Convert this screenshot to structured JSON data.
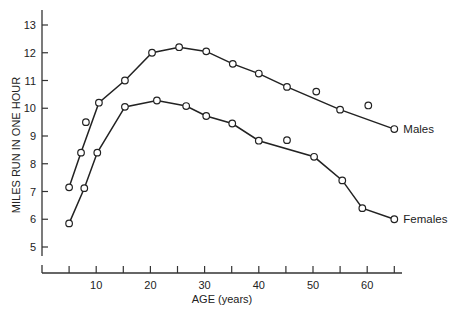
{
  "chart_data": {
    "type": "line",
    "title": "",
    "xlabel": "AGE (years)",
    "ylabel": "MILES RUN IN ONE HOUR",
    "xlim": [
      0,
      66
    ],
    "ylim": [
      4.5,
      13.5
    ],
    "x_ticks": [
      5,
      10,
      15,
      20,
      25,
      30,
      35,
      40,
      45,
      50,
      55,
      60,
      65
    ],
    "x_tick_labels": [
      {
        "value": 10,
        "label": "10"
      },
      {
        "value": 20,
        "label": "20"
      },
      {
        "value": 30,
        "label": "30"
      },
      {
        "value": 40,
        "label": "40"
      },
      {
        "value": 50,
        "label": "50"
      },
      {
        "value": 60,
        "label": "60"
      }
    ],
    "y_ticks": [
      5,
      6,
      7,
      8,
      9,
      10,
      11,
      12,
      13
    ],
    "y_tick_labels": [
      "5",
      "6",
      "7",
      "8",
      "9",
      "10",
      "11",
      "12",
      "13"
    ],
    "grid": false,
    "legend_position": "inline-right",
    "series": [
      {
        "name": "Males",
        "label": "Males",
        "x": [
          5,
          7.2,
          10.5,
          15.3,
          20.3,
          25.3,
          30.3,
          35.2,
          40,
          45.2,
          55,
          65
        ],
        "y": [
          7.15,
          8.4,
          10.2,
          11.0,
          12.0,
          12.2,
          12.05,
          11.6,
          11.25,
          10.77,
          9.95,
          9.25
        ],
        "outliers": {
          "x": [
            8.1,
            50.6,
            60.2
          ],
          "y": [
            9.5,
            10.6,
            10.1
          ]
        }
      },
      {
        "name": "Females",
        "label": "Females",
        "x": [
          5,
          7.8,
          10.2,
          15.3,
          21.2,
          26.6,
          30.3,
          35.1,
          40,
          50.2,
          55.4,
          59.1,
          65
        ],
        "y": [
          5.85,
          7.12,
          8.4,
          10.05,
          10.28,
          10.08,
          9.72,
          9.45,
          8.83,
          8.25,
          7.4,
          6.4,
          6.0
        ],
        "outliers": {
          "x": [
            45.2
          ],
          "y": [
            8.85
          ]
        }
      }
    ]
  }
}
